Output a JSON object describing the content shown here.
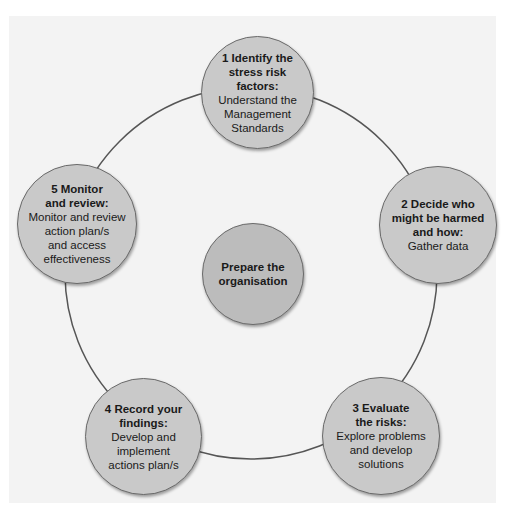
{
  "diagram": {
    "type": "cycle",
    "colors": {
      "background": "#ffffff",
      "panel": "#f3f3f3",
      "node_fill": "#c9c9c9",
      "center_fill": "#bcbcbc",
      "stroke": "#555555"
    },
    "center": {
      "title": "Prepare the\norganisation"
    },
    "steps": [
      {
        "number": 1,
        "title": "1 Identify the\nstress risk\nfactors:",
        "desc": "Understand the\nManagement\nStandards"
      },
      {
        "number": 2,
        "title": "2 Decide who\nmight be harmed\nand how:",
        "desc": "Gather data"
      },
      {
        "number": 3,
        "title": "3 Evaluate\nthe risks:",
        "desc": "Explore problems\nand develop\nsolutions"
      },
      {
        "number": 4,
        "title": "4 Record your\nfindings:",
        "desc": "Develop and\nimplement\nactions plan/s"
      },
      {
        "number": 5,
        "title": "5 Monitor\nand review:",
        "desc": "Monitor and review\naction plan/s\nand access\neffectiveness"
      }
    ]
  }
}
